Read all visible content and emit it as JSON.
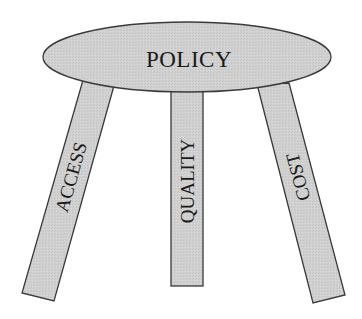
{
  "diagram": {
    "seat": {
      "label": "POLICY"
    },
    "legs": [
      {
        "id": "access",
        "label": "ACCESS"
      },
      {
        "id": "quality",
        "label": "QUALITY"
      },
      {
        "id": "cost",
        "label": "COST"
      }
    ],
    "colors": {
      "fill": "#cfcfcf",
      "stroke": "#3a3a3a",
      "text": "#1a1a1a",
      "background": "#ffffff"
    }
  }
}
